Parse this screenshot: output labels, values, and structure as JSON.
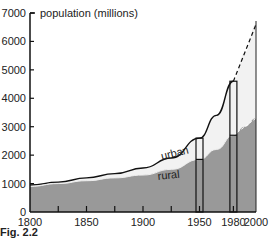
{
  "chart_data": {
    "type": "area",
    "title": "population (millions)",
    "xlabel": "",
    "ylabel": "population (millions)",
    "xlim": [
      1800,
      2000
    ],
    "ylim": [
      0,
      7000
    ],
    "x_ticks": [
      1800,
      1850,
      1900,
      1950,
      1980,
      2000
    ],
    "x_minor_ticks": [
      1825,
      1850,
      1875,
      1900,
      1925,
      1950,
      1980
    ],
    "y_ticks": [
      0,
      1000,
      2000,
      3000,
      4000,
      5000,
      6000,
      7000
    ],
    "grid": false,
    "legend": "inline labels",
    "series": [
      {
        "name": "rural",
        "fill": "#999999",
        "x": [
          1800,
          1825,
          1850,
          1875,
          1900,
          1925,
          1950,
          1965,
          1980,
          1990,
          2000
        ],
        "values": [
          900,
          1000,
          1100,
          1200,
          1300,
          1500,
          1850,
          2200,
          2700,
          3000,
          3300
        ],
        "projected_from": 1980
      },
      {
        "name": "urban",
        "fill": "#f2f2f2",
        "x": [
          1800,
          1825,
          1850,
          1875,
          1900,
          1925,
          1950,
          1965,
          1980,
          1990,
          2000
        ],
        "values_total": [
          950,
          1050,
          1200,
          1350,
          1550,
          1900,
          2600,
          3400,
          4600,
          5600,
          6600
        ],
        "projected_from": 1980
      }
    ],
    "highlight_bars": [
      {
        "year": 1950,
        "total": 2600,
        "rural": 1850
      },
      {
        "year": 1980,
        "total": 4600,
        "rural": 2700
      }
    ],
    "annotations": [
      {
        "text": "urban",
        "x": 1925,
        "y": 2200
      },
      {
        "text": "rural",
        "x": 1925,
        "y": 1500
      }
    ]
  },
  "labels": {
    "title": "population (millions)",
    "urban": "urban",
    "rural": "rural",
    "caption": "Fig. 2.2"
  }
}
